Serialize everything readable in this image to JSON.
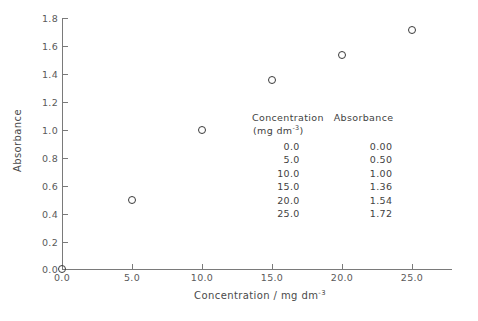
{
  "chart_data": {
    "type": "scatter",
    "title": "",
    "xlabel": "Concentration / mg dm-3",
    "ylabel": "Absorbance",
    "xlim": [
      0.0,
      25.0
    ],
    "ylim": [
      0.0,
      1.8
    ],
    "grid": false,
    "legend": "none",
    "marker_style": "open-circle",
    "x": [
      0.0,
      5.0,
      10.0,
      15.0,
      20.0,
      25.0
    ],
    "values": [
      0.0,
      0.5,
      1.0,
      1.36,
      1.54,
      1.72
    ],
    "series": [
      {
        "name": "Absorbance",
        "values": [
          0.0,
          0.5,
          1.0,
          1.36,
          1.54,
          1.72
        ]
      }
    ],
    "xticks": [
      "0.0",
      "5.0",
      "10.0",
      "15.0",
      "20.0",
      "25.0"
    ],
    "yticks": [
      "0.0",
      "0.2",
      "0.4",
      "0.6",
      "0.8",
      "1.0",
      "1.2",
      "1.4",
      "1.6",
      "1.8"
    ]
  },
  "axes": {
    "y_title": "Absorbance",
    "x_title_main": "Concentration / mg dm",
    "x_title_exponent": "-3",
    "y_tick_labels": [
      "1.8",
      "1.6",
      "1.4",
      "1.2",
      "1.0",
      "0.8",
      "0.6",
      "0.4",
      "0.2",
      "0.0"
    ],
    "x_tick_labels": [
      "0.0",
      "5.0",
      "10.0",
      "15.0",
      "20.0",
      "25.0"
    ]
  },
  "data_table": {
    "header_concentration": "Concentration",
    "header_absorbance": "Absorbance",
    "units_concentration_main": "(mg dm",
    "units_concentration_exponent": "-3",
    "units_concentration_close": ")",
    "rows": [
      {
        "concentration": "0.0",
        "absorbance": "0.00"
      },
      {
        "concentration": "5.0",
        "absorbance": "0.50"
      },
      {
        "concentration": "10.0",
        "absorbance": "1.00"
      },
      {
        "concentration": "15.0",
        "absorbance": "1.36"
      },
      {
        "concentration": "20.0",
        "absorbance": "1.54"
      },
      {
        "concentration": "25.0",
        "absorbance": "1.72"
      }
    ]
  },
  "colors": {
    "axis": "#7a7a7a",
    "marker": "#3a3a3a",
    "text": "#4a4a4a",
    "background": "#ffffff"
  }
}
